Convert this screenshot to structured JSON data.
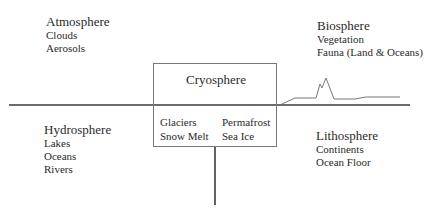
{
  "diagram": {
    "center": {
      "title": "Cryosphere",
      "left_items": [
        "Glaciers",
        "Snow Melt"
      ],
      "right_items": [
        "Permafrost",
        "Sea Ice"
      ]
    },
    "quadrants": {
      "top_left": {
        "title": "Atmosphere",
        "items": [
          "Clouds",
          "Aerosols"
        ]
      },
      "top_right": {
        "title": "Biosphere",
        "items": [
          "Vegetation",
          "Fauna (Land & Oceans)"
        ]
      },
      "bottom_left": {
        "title": "Hydrosphere",
        "items": [
          "Lakes",
          "Oceans",
          "Rivers"
        ]
      },
      "bottom_right": {
        "title": "Lithosphere",
        "items": [
          "Continents",
          "Ocean Floor"
        ]
      }
    },
    "colors": {
      "line": "#3a3a3a",
      "box_border": "#777777",
      "text": "#2a2a2a"
    }
  }
}
